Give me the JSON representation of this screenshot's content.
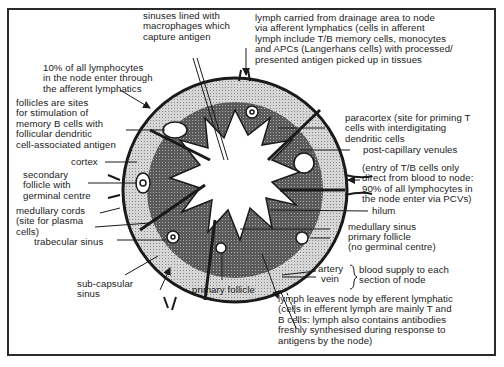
{
  "figure": {
    "labels": {
      "sinuses": "sinuses lined with\nmacrophages which\ncapture antigen",
      "afferent_lymph": "lymph carried from drainage area to node\nvia afferent lymphatics (cells in afferent\nlymph include T/B memory cells, monocytes\nand APCs (Langerhans cells) with processed/\npresented antigen picked up in tissues",
      "ten_percent": "10% of all lymphocytes\nin the node enter through\nthe afferent lymphatics",
      "follicles": "follicles are sites\nfor stimulation of\nmemory B cells with\nfollicular dendritic\ncell-associated antigen",
      "cortex": "cortex",
      "secondary_follicle": "secondary\nfollicle with\ngerminal centre",
      "medullary_cords": "medullary cords\n(site for plasma\ncells)",
      "trabecular_sinus": "trabecular sinus",
      "subcapsular_sinus": "sub-capsular\nsinus",
      "primary_follicle_bottom": "primary follicle",
      "paracortex": "paracortex (site for priming T\ncells with interdigitating\ndendritic cells",
      "post_capillary": "post-capillary venules",
      "pcv_entry": "(entry of T/B cells only\ndirect from blood to node:\n90% of all lymphocytes in\nthe node enter via PCVs)",
      "hilum": "hilum",
      "medullary_sinus": "medullary sinus",
      "primary_follicle_right": "primary follicle\n(no germinal centre)",
      "artery": "artery",
      "vein": "vein",
      "blood_supply": "blood supply to each\nsection of node",
      "efferent_lymph": "lymph leaves node by efferent lymphatic\n(cells in efferent lymph are mainly T and\nB cells: lymph also contains antibodies\nfreshly synthesised during response to\nantigens by the node)"
    },
    "colors": {
      "ink": "#1a1a1a",
      "outer_cortex": "#c8c8c8",
      "paracortex": "#6e6e6e",
      "medulla": "#ffffff"
    }
  }
}
